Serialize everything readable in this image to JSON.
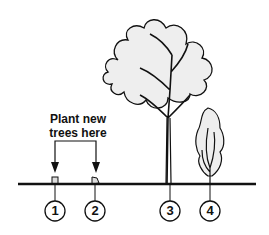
{
  "diagram": {
    "label_line1": "Plant new",
    "label_line2": "trees here",
    "markers": [
      "1",
      "2",
      "3",
      "4"
    ],
    "colors": {
      "ink": "#111111",
      "foliage": "#eeeeee",
      "background": "#ffffff"
    }
  }
}
